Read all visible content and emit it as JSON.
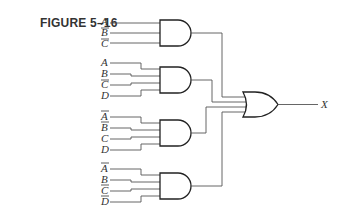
{
  "figure": {
    "label": "FIGURE 5–16",
    "output_label": "X"
  },
  "gates": [
    {
      "type": "AND",
      "inputs": [
        {
          "name": "A",
          "inverted": false
        },
        {
          "name": "B",
          "inverted": true
        },
        {
          "name": "C",
          "inverted": true
        }
      ]
    },
    {
      "type": "AND",
      "inputs": [
        {
          "name": "A",
          "inverted": false
        },
        {
          "name": "B",
          "inverted": false
        },
        {
          "name": "C",
          "inverted": true
        },
        {
          "name": "D",
          "inverted": false
        }
      ]
    },
    {
      "type": "AND",
      "inputs": [
        {
          "name": "A",
          "inverted": true
        },
        {
          "name": "B",
          "inverted": true
        },
        {
          "name": "C",
          "inverted": false
        },
        {
          "name": "D",
          "inverted": false
        }
      ]
    },
    {
      "type": "AND",
      "inputs": [
        {
          "name": "A",
          "inverted": true
        },
        {
          "name": "B",
          "inverted": false
        },
        {
          "name": "C",
          "inverted": true
        },
        {
          "name": "D",
          "inverted": true
        }
      ]
    }
  ],
  "output_gate": {
    "type": "OR",
    "inputs": 4
  }
}
